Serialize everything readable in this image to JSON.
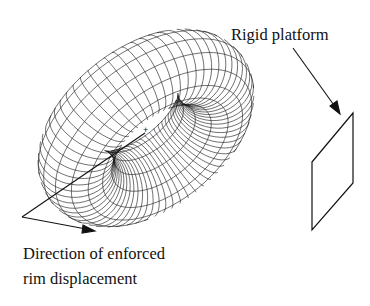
{
  "labels": {
    "platform": "Rigid platform",
    "direction_line1": "Direction of enforced",
    "direction_line2": "rim displacement",
    "center_marker": "+"
  },
  "figure": {
    "stroke_color": "#111111",
    "background": "#ffffff",
    "torus": {
      "cx": 146,
      "cy": 128,
      "R": 82,
      "r": 38,
      "tilt_deg": 58,
      "rot_deg": -38,
      "u_segments": 64,
      "v_segments": 14,
      "major_every": 4
    },
    "platform_polygon": [
      [
        312,
        162
      ],
      [
        353,
        113
      ],
      [
        353,
        183
      ],
      [
        312,
        230
      ]
    ]
  }
}
